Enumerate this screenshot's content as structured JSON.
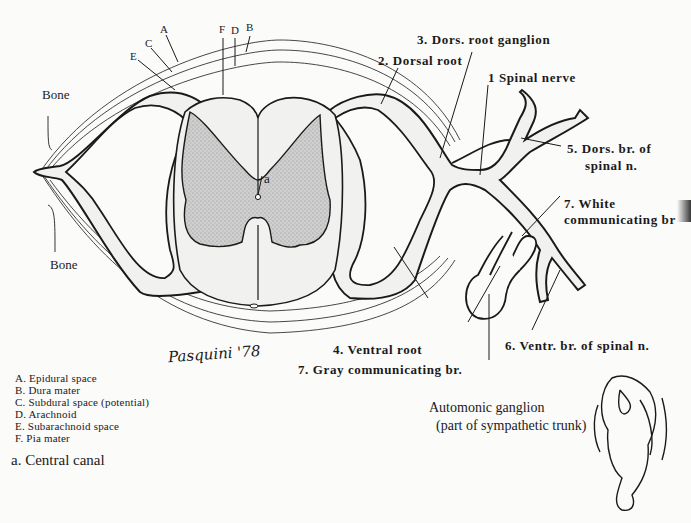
{
  "figure": {
    "layer_letters": {
      "A": "A",
      "B": "B",
      "C": "C",
      "D": "D",
      "E": "E",
      "F": "F"
    },
    "central_canal_marker": "a",
    "bone_top": "Bone",
    "bone_bottom": "Bone",
    "labels": {
      "spinal_nerve": "1 Spinal nerve",
      "dorsal_root": "2. Dorsal root",
      "dors_root_ganglion": "3. Dors. root ganglion",
      "ventral_root": "4. Ventral root",
      "dors_br_line1": "5. Dors. br. of",
      "dors_br_line2": "spinal n.",
      "ventr_br": "6. Ventr. br. of spinal n.",
      "white_comm_line1": "7. White",
      "white_comm_line2": "communicating br",
      "gray_comm": "7. Gray communicating br.",
      "autonomic_line1": "Automonic ganglion",
      "autonomic_line2": "(part of sympathetic trunk)"
    },
    "legend": [
      "A. Epidural space",
      "B. Dura mater",
      "C. Subdural space (potential)",
      "D. Arachnoid",
      "E. Subarachnoid space",
      "F. Pia mater"
    ],
    "footnote": "a. Central canal",
    "signature": "Pasquini '78",
    "colors": {
      "background": "#fbfbfa",
      "ink": "#1a1a1a",
      "gray_matter": "#c9c9c9",
      "white_matter": "#f1f1ef"
    }
  }
}
